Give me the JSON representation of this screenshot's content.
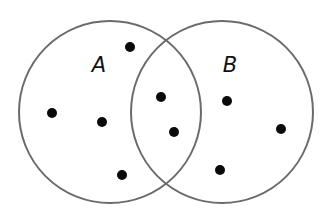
{
  "diagram": {
    "type": "venn",
    "colors": {
      "background": "#ffffff",
      "circle_stroke": "#6b6b6b",
      "dot": "#0a0a0a",
      "label": "#111111"
    },
    "sets": [
      {
        "id": "A",
        "label": "A",
        "cx": 110,
        "cy": 112,
        "r": 91,
        "label_x": 99,
        "label_y": 72
      },
      {
        "id": "B",
        "label": "B",
        "cx": 222,
        "cy": 112,
        "r": 91,
        "label_x": 230,
        "label_y": 72
      }
    ],
    "elements": [
      {
        "region": "A only",
        "x": 130,
        "y": 47
      },
      {
        "region": "A only",
        "x": 52,
        "y": 113
      },
      {
        "region": "A only",
        "x": 102,
        "y": 122
      },
      {
        "region": "A only",
        "x": 122,
        "y": 175
      },
      {
        "region": "A and B",
        "x": 161,
        "y": 97
      },
      {
        "region": "A and B",
        "x": 174,
        "y": 132
      },
      {
        "region": "B only",
        "x": 227,
        "y": 101
      },
      {
        "region": "B only",
        "x": 281,
        "y": 129
      },
      {
        "region": "B only",
        "x": 220,
        "y": 170
      }
    ],
    "counts": {
      "A_only": 4,
      "A_and_B": 2,
      "B_only": 3,
      "A_total": 6,
      "B_total": 5
    }
  }
}
